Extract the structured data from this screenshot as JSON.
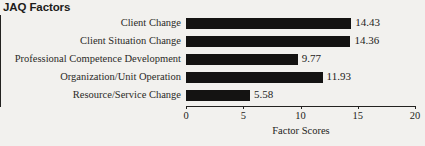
{
  "chart_data": {
    "type": "bar",
    "orientation": "horizontal",
    "title": "JAQ Factors",
    "xlabel": "Factor Scores",
    "ylabel": "",
    "xlim": [
      0,
      20
    ],
    "xticks": [
      0,
      5,
      10,
      15,
      20
    ],
    "xtick_labels": [
      "0",
      "5",
      "10",
      "15",
      "20"
    ],
    "grid": false,
    "legend": null,
    "bar_color": "#141312",
    "background_color": "#f2f1ee",
    "categories": [
      "Client Change",
      "Client Situation Change",
      "Professional Competence Development",
      "Organization/Unit Operation",
      "Resource/Service Change"
    ],
    "values": [
      14.43,
      14.36,
      9.77,
      11.93,
      5.58
    ],
    "value_labels": [
      "14.43",
      "14.36",
      "9.77",
      "11.93",
      "5.58"
    ]
  }
}
